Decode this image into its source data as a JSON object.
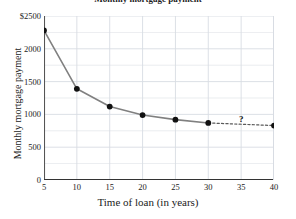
{
  "chart_data": {
    "type": "line",
    "title": "Monthly mortgage payment",
    "xlabel": "Time of loan (in years)",
    "ylabel": "Monthly mortgage payment",
    "xlim": [
      5,
      40
    ],
    "ylim": [
      0,
      2500
    ],
    "xticks": [
      5,
      10,
      15,
      20,
      25,
      30,
      35,
      40
    ],
    "xtick_labels": [
      "5",
      "10",
      "15",
      "20",
      "25",
      "30",
      "35",
      "40"
    ],
    "yticks": [
      0,
      500,
      1000,
      1500,
      2000,
      2500
    ],
    "ytick_labels": [
      "0",
      "500",
      "1000",
      "1500",
      "2000",
      "$2500"
    ],
    "minor_yticks": [
      250,
      750,
      1250,
      1750,
      2250
    ],
    "grid": true,
    "legend": false,
    "series": [
      {
        "name": "Monthly mortgage payment",
        "style": "solid",
        "x": [
          5,
          10,
          15,
          20,
          25,
          30
        ],
        "values": [
          2280,
          1390,
          1120,
          990,
          920,
          870
        ]
      },
      {
        "name": "Extrapolated segment",
        "style": "dashed",
        "x": [
          30,
          40
        ],
        "values": [
          870,
          830
        ]
      }
    ],
    "markers": {
      "x": [
        5,
        10,
        15,
        20,
        25,
        30,
        40
      ],
      "values": [
        2280,
        1390,
        1120,
        990,
        920,
        870,
        830
      ]
    },
    "annotations": [
      {
        "text": "?",
        "x": 35,
        "y": 850
      }
    ],
    "colors": {
      "line": "#808080",
      "dashed_line": "#5a5a5a",
      "marker": "#111111",
      "grid": "#d8dce3",
      "axis": "#555555",
      "text": "#1b1b1b",
      "background": "#ffffff"
    }
  }
}
